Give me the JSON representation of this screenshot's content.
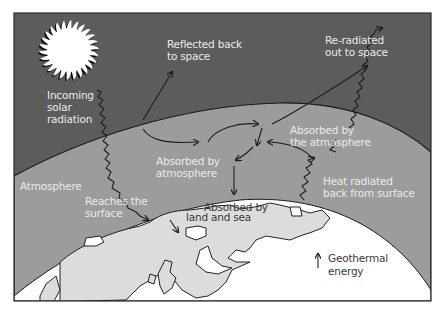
{
  "diagram": {
    "colors": {
      "space": "#5c5c5c",
      "atmosphere": "#9c9c9c",
      "earth": "#ffffff",
      "land": "#dcdcdc",
      "border": "#2a2a2a"
    },
    "regions": {
      "space": "space",
      "atmosphere": "Atmosphere",
      "surface": "Earth surface"
    },
    "labels": {
      "incoming": [
        "Incoming",
        "solar",
        "radiation"
      ],
      "reflected": [
        "Reflected back",
        "to space"
      ],
      "reradiated": [
        "Re-radiated",
        "out to space"
      ],
      "absorbed_atmosphere_right": [
        "Absorbed by",
        "the atmosphere"
      ],
      "absorbed_atmosphere_center": [
        "Absorbed by",
        "atmosphere"
      ],
      "atmosphere": "Atmosphere",
      "reaches_surface": [
        "Reaches the",
        "surface"
      ],
      "absorbed_land": [
        "Absorbed by",
        "land and sea"
      ],
      "heat_radiated": [
        "Heat radiated",
        "back from surface"
      ],
      "geothermal": [
        "Geothermal",
        "energy"
      ]
    },
    "icons": {
      "sun": "sun-icon",
      "geothermal": "up-arrow-icon"
    }
  }
}
